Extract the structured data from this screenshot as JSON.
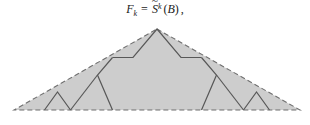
{
  "formula": {
    "lhs_symbol": "F",
    "lhs_subscript": "k",
    "equals": "=",
    "operator_symbol": "S",
    "operator_accent": "~",
    "operator_superscript": "k",
    "open_paren": "(",
    "argument": "B",
    "close_paren": ")",
    "trailing_punctuation": ",",
    "plain_text": "F_k = S~^k (B) ,"
  },
  "figure": {
    "caption_text": "",
    "colors": {
      "fill": "#cdcdcd",
      "dashed_outline": "#6f6f6f",
      "solid_line": "#585858",
      "background": "#ffffff",
      "text": "#1a1a1a"
    },
    "geometry": {
      "apex": [
        157,
        29
      ],
      "base_left": [
        14,
        110
      ],
      "base_right": [
        300,
        110
      ],
      "outer_path": "M 157 29 L 300 110 L 14 110 Z",
      "interior_lines": [
        "M 112.5 57.5 L 133.0 57.5 L 157.0 29.0 L 181.0 57.5 L 201.5 57.5",
        "M 112.5 57.5 L 97.5 75.0 L 112.5 110.0",
        "M 201.5 57.5 L 216.5 75.0 L 201.5 110.0",
        "M 44.5 110.0 L 57.5 92.0 L 70.5 110.0",
        "M 243.5 110.0 L 256.5 92.0 L 269.5 110.0",
        "M 70.5 110.0 L 97.5 75.0",
        "M 243.5 110.0 L 216.5 75.0"
      ],
      "dash_pattern": "5,3",
      "stroke_width_outline": 1.1,
      "stroke_width_interior": 1.2
    }
  }
}
